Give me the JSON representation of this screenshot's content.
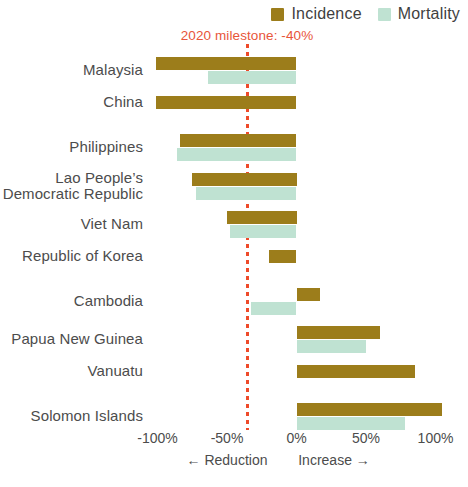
{
  "legend": {
    "items": [
      {
        "label": "Incidence",
        "color": "#9c7d1b",
        "icon": "square-swatch-icon"
      },
      {
        "label": "Mortality",
        "color": "#bfe2d2",
        "icon": "square-swatch-icon"
      }
    ]
  },
  "annotation": {
    "milestone_text": "2020 milestone: -40%",
    "milestone_value": -40,
    "color": "#e8553a"
  },
  "axis": {
    "ticks": [
      "-100%",
      "-50%",
      "0%",
      "50%",
      "100%"
    ],
    "tick_values": [
      -100,
      -50,
      0,
      50,
      100
    ],
    "captions": [
      "← Reduction",
      "Increase →"
    ]
  },
  "chart_data": {
    "type": "bar",
    "orientation": "horizontal",
    "title": "",
    "subtitle": "",
    "xlabel": "",
    "ylabel": "",
    "xlim": [
      -100,
      110
    ],
    "grid": false,
    "legend_position": "top-right",
    "categories": [
      "Malaysia",
      "China",
      "Philippines",
      "Lao People’s\nDemocratic Republic",
      "Viet Nam",
      "Republic of Korea",
      "Cambodia",
      "Papua New Guinea",
      "Vanuatu",
      "Solomon Islands"
    ],
    "series": [
      {
        "name": "Incidence",
        "color": "#9c7d1b",
        "values": [
          -101,
          -101,
          -84,
          -75,
          -50,
          -20,
          17,
          60,
          85,
          105
        ]
      },
      {
        "name": "Mortality",
        "color": "#bfe2d2",
        "values": [
          -64,
          null,
          -86,
          -72,
          -48,
          null,
          -33,
          50,
          null,
          78
        ]
      }
    ],
    "annotations": [
      {
        "type": "vline",
        "value": -40,
        "label": "2020 milestone: -40%",
        "color": "#e8553a",
        "style": "dotted"
      }
    ]
  }
}
